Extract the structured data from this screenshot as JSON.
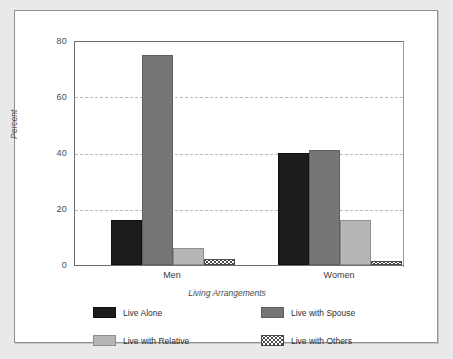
{
  "chart_data": {
    "type": "bar",
    "title": "",
    "xlabel": "Living Arrangements",
    "ylabel": "Percent",
    "categories": [
      "Men",
      "Women"
    ],
    "ylim": [
      0,
      80
    ],
    "yticks": [
      0,
      20,
      40,
      60,
      80
    ],
    "grid": true,
    "legend_position": "bottom",
    "series": [
      {
        "name": "Live Alone",
        "color": "#1c1c1c",
        "values": [
          16,
          40
        ]
      },
      {
        "name": "Live with Spouse",
        "color": "#767676",
        "values": [
          75,
          41
        ]
      },
      {
        "name": "Live with Relative",
        "color": "#b6b6b6",
        "values": [
          6,
          16
        ]
      },
      {
        "name": "Live with Others",
        "color": "#ffffff",
        "pattern": "dotted",
        "values": [
          2,
          1.5
        ]
      }
    ]
  },
  "axes": {
    "y_tick_labels": [
      "80",
      "60",
      "40",
      "20",
      "0"
    ],
    "y_title": "Percent",
    "x_tick_labels": [
      "Men",
      "Women"
    ],
    "x_title": "Living Arrangements"
  },
  "legend": {
    "items": [
      {
        "label": "Live Alone",
        "swatch": "dark-swatch"
      },
      {
        "label": "Live with Spouse",
        "swatch": "medium-gray-swatch"
      },
      {
        "label": "Live with Relative",
        "swatch": "light-gray-swatch"
      },
      {
        "label": "Live with Others",
        "swatch": "dotted-swatch"
      }
    ]
  },
  "colors": {
    "live_alone": "#1c1c1c",
    "live_with_spouse": "#767676",
    "live_with_relative": "#b6b6b6",
    "live_with_others": "#ffffff",
    "gridline": "#b9b9b9",
    "axis": "#6e6e6e",
    "background": "#ffffff",
    "page_background": "#e9e9e9"
  }
}
